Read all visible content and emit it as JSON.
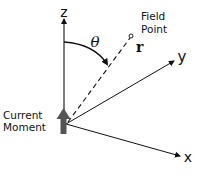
{
  "diagram": {
    "axes": {
      "z_label": "z",
      "y_label": "y",
      "x_label": "x"
    },
    "angle_label": "θ",
    "vector_label": "r",
    "field_point_label": [
      "Field",
      "Point"
    ],
    "source_label": [
      "Current",
      "Moment"
    ],
    "colors": {
      "line": "#111111",
      "current_moment_arrow": "#555555",
      "text": "#111111"
    }
  }
}
